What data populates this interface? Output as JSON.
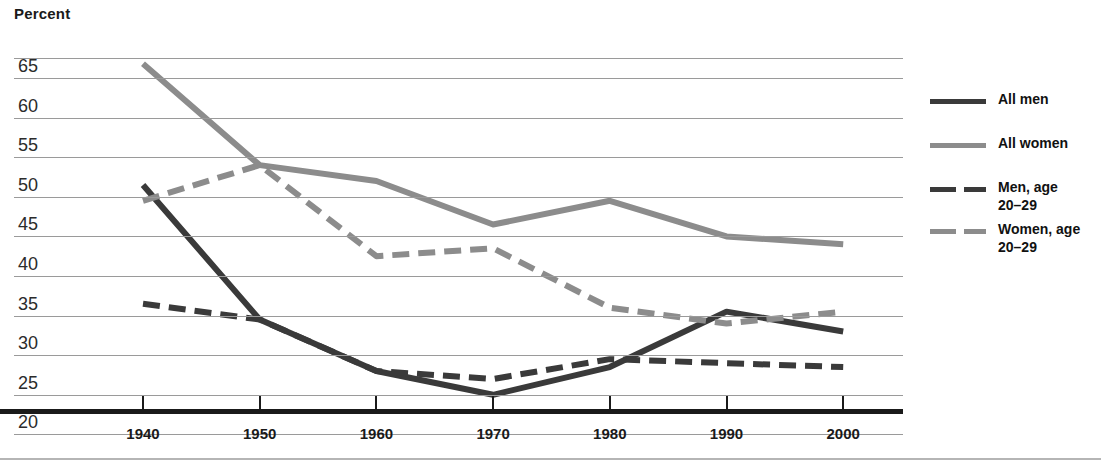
{
  "chart_data": {
    "type": "line",
    "title": "",
    "ylabel": "Percent",
    "xlabel": "",
    "categories": [
      1940,
      1950,
      1960,
      1970,
      1980,
      1990,
      2000
    ],
    "x": [
      1940,
      1950,
      1960,
      1970,
      1980,
      1990,
      2000
    ],
    "ylim": [
      20,
      67
    ],
    "xlim": [
      1940,
      2000
    ],
    "grid": true,
    "legend_position": "right",
    "yticks": [
      20,
      25,
      30,
      35,
      40,
      45,
      50,
      55,
      60,
      65
    ],
    "xticks": [
      1940,
      1950,
      1960,
      1970,
      1980,
      1990,
      2000
    ],
    "series": [
      {
        "name": "All men",
        "style": "solid",
        "color": "#3a3a3a",
        "values": [
          51.5,
          34.5,
          28.0,
          25.0,
          28.5,
          35.5,
          33.0
        ]
      },
      {
        "name": "All women",
        "style": "solid",
        "color": "#8c8c8c",
        "values": [
          66.8,
          54.0,
          52.0,
          46.5,
          49.5,
          45.0,
          44.0
        ]
      },
      {
        "name": "Men, age\n20–29",
        "style": "dashed",
        "color": "#3a3a3a",
        "values": [
          36.5,
          34.5,
          28.0,
          27.0,
          29.5,
          29.0,
          28.5
        ]
      },
      {
        "name": "Women, age\n20–29",
        "style": "dashed",
        "color": "#8c8c8c",
        "values": [
          49.5,
          54.0,
          42.5,
          43.5,
          36.0,
          34.0,
          35.5
        ]
      }
    ]
  },
  "axis": {
    "y_title": "Percent",
    "y_tick_labels": [
      "65",
      "60",
      "55",
      "50",
      "45",
      "40",
      "35",
      "30",
      "25",
      "20"
    ],
    "x_tick_labels": [
      "1940",
      "1950",
      "1960",
      "1970",
      "1980",
      "1990",
      "2000"
    ]
  },
  "legend": {
    "items": [
      {
        "label": "All men",
        "swatch": "solid-dark"
      },
      {
        "label": "All women",
        "swatch": "solid-gray"
      },
      {
        "label": "Men, age\n20–29",
        "swatch": "dash-dark"
      },
      {
        "label": "Women, age\n20–29",
        "swatch": "dash-gray"
      }
    ]
  },
  "colors": {
    "dark_series": "#3a3a3a",
    "gray_series": "#8c8c8c",
    "gridline": "#9a9a9a",
    "axis": "#1a1a1a",
    "text": "#111111"
  }
}
